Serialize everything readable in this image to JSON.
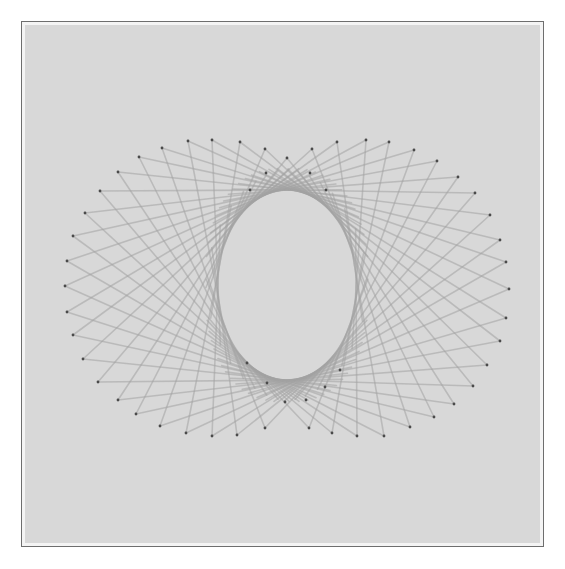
{
  "image": {
    "subject": "String art on gray board",
    "board_color": "#d8d8d8",
    "string_color": "#a3a3a3",
    "pin_color": "#4a4a4a"
  },
  "oval": {
    "cx": 287,
    "cy": 285,
    "rx": 69,
    "ry": 95
  },
  "outer_pins": [
    [
      287,
      158
    ],
    [
      312,
      149
    ],
    [
      337,
      142
    ],
    [
      366,
      140
    ],
    [
      389,
      142
    ],
    [
      414,
      150
    ],
    [
      437,
      161
    ],
    [
      458,
      177
    ],
    [
      475,
      193
    ],
    [
      490,
      215
    ],
    [
      500,
      240
    ],
    [
      506,
      262
    ],
    [
      509,
      289
    ],
    [
      506,
      318
    ],
    [
      500,
      341
    ],
    [
      487,
      365
    ],
    [
      473,
      386
    ],
    [
      454,
      404
    ],
    [
      434,
      417
    ],
    [
      410,
      427
    ],
    [
      384,
      436
    ],
    [
      357,
      436
    ],
    [
      332,
      433
    ],
    [
      309,
      428
    ],
    [
      265,
      428
    ],
    [
      237,
      435
    ],
    [
      212,
      436
    ],
    [
      186,
      433
    ],
    [
      160,
      426
    ],
    [
      136,
      414
    ],
    [
      118,
      400
    ],
    [
      98,
      382
    ],
    [
      83,
      359
    ],
    [
      73,
      335
    ],
    [
      67,
      312
    ],
    [
      65,
      286
    ],
    [
      67,
      261
    ],
    [
      73,
      236
    ],
    [
      85,
      213
    ],
    [
      100,
      191
    ],
    [
      118,
      172
    ],
    [
      139,
      157
    ],
    [
      162,
      148
    ],
    [
      188,
      141
    ],
    [
      212,
      140
    ],
    [
      240,
      142
    ],
    [
      265,
      149
    ]
  ],
  "inner_pins": [
    [
      266,
      173
    ],
    [
      310,
      173
    ],
    [
      250,
      190
    ],
    [
      326,
      190
    ],
    [
      247,
      363
    ],
    [
      267,
      383
    ],
    [
      306,
      400
    ],
    [
      285,
      402
    ],
    [
      325,
      387
    ],
    [
      340,
      370
    ]
  ]
}
